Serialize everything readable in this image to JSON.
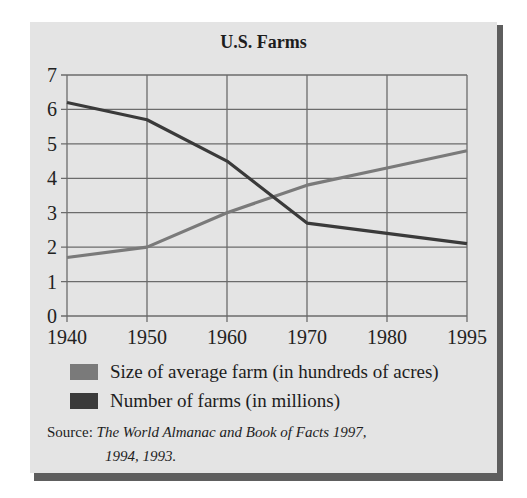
{
  "chart_data": {
    "type": "line",
    "title": "U.S. Farms",
    "xlabel": "",
    "ylabel": "",
    "categories": [
      "1940",
      "1950",
      "1960",
      "1970",
      "1980",
      "1995"
    ],
    "ylim": [
      0,
      7
    ],
    "yticks": [
      0,
      1,
      2,
      3,
      4,
      5,
      6,
      7
    ],
    "grid": true,
    "legend_position": "bottom",
    "series": [
      {
        "name": "Size of average farm (in hundreds of acres)",
        "color": "#7a7a7a",
        "values": [
          1.7,
          2.0,
          3.0,
          3.8,
          4.3,
          4.8
        ]
      },
      {
        "name": "Number of farms (in millions)",
        "color": "#3a3a3a",
        "values": [
          6.2,
          5.7,
          4.5,
          2.7,
          2.4,
          2.1
        ]
      }
    ]
  },
  "source": {
    "label": "Source:",
    "work_line1": "The World Almanac and Book of Facts 1997,",
    "work_line2": "1994, 1993."
  }
}
